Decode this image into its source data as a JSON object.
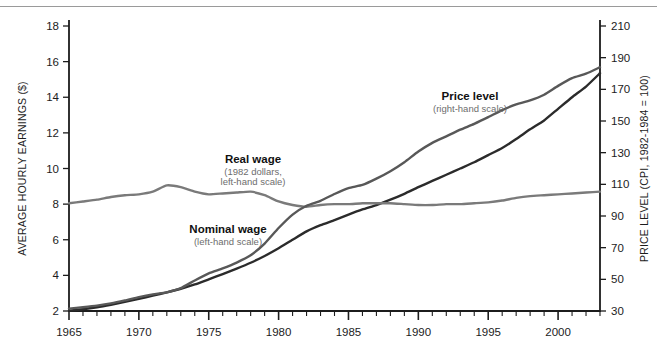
{
  "figure": {
    "background": "#ffffff",
    "border_color": "#9a9a9a"
  },
  "axes": {
    "left": {
      "title": "AVERAGE HOURLY EARNINGS ($)",
      "ticks": [
        "2",
        "4",
        "6",
        "8",
        "10",
        "12",
        "14",
        "16",
        "18"
      ],
      "min": 2,
      "max": 18
    },
    "right": {
      "title": "PRICE LEVEL (CPI, 1982-1984 = 100)",
      "ticks": [
        "30",
        "50",
        "70",
        "90",
        "110",
        "130",
        "150",
        "170",
        "190",
        "210"
      ],
      "min": 30,
      "max": 210
    },
    "bottom": {
      "ticks": [
        "1965",
        "1970",
        "1975",
        "1980",
        "1985",
        "1990",
        "1995",
        "2000"
      ],
      "min": 1965,
      "max": 2003
    }
  },
  "annotations": [
    {
      "id": "real-wage",
      "title": "Real wage",
      "sub_line1": "(1982 dollars,",
      "sub_line2": "left-hand scale)",
      "x": 253,
      "y": 163
    },
    {
      "id": "nominal-wage",
      "title": "Nominal wage",
      "sub_line1": "(left-hand scale)",
      "sub_line2": "",
      "x": 228,
      "y": 233
    },
    {
      "id": "price-level",
      "title": "Price level",
      "sub_line1": "(right-hand scale)",
      "sub_line2": "",
      "x": 470,
      "y": 100
    }
  ],
  "colors": {
    "nominal_wage": "#2b2b2b",
    "real_wage": "#7a7a7a",
    "price_level": "#585858",
    "axis": "#1c1c1c"
  },
  "chart_data": {
    "type": "line",
    "title": "",
    "xlabel": "",
    "ylabel": "AVERAGE HOURLY EARNINGS ($)",
    "y2label": "PRICE LEVEL (CPI, 1982-1984 = 100)",
    "xlim": [
      1965,
      2003
    ],
    "ylim": [
      2,
      18
    ],
    "y2lim": [
      30,
      210
    ],
    "grid": false,
    "legend": "annotations-inline",
    "x": [
      1965,
      1966,
      1967,
      1968,
      1969,
      1970,
      1971,
      1972,
      1973,
      1974,
      1975,
      1976,
      1977,
      1978,
      1979,
      1980,
      1981,
      1982,
      1983,
      1984,
      1985,
      1986,
      1987,
      1988,
      1989,
      1990,
      1991,
      1992,
      1993,
      1994,
      1995,
      1996,
      1997,
      1998,
      1999,
      2000,
      2001,
      2002,
      2003
    ],
    "series": [
      {
        "name": "Nominal wage",
        "axis": "left",
        "units": "dollars per hour",
        "color": "#2b2b2b",
        "values": [
          2.02,
          2.1,
          2.21,
          2.35,
          2.51,
          2.68,
          2.86,
          3.05,
          3.25,
          3.49,
          3.78,
          4.07,
          4.38,
          4.71,
          5.09,
          5.52,
          6.0,
          6.47,
          6.82,
          7.1,
          7.41,
          7.7,
          7.95,
          8.25,
          8.58,
          8.95,
          9.3,
          9.65,
          10.0,
          10.35,
          10.75,
          11.15,
          11.65,
          12.2,
          12.7,
          13.35,
          14.0,
          14.6,
          15.35
        ]
      },
      {
        "name": "Real wage",
        "axis": "left",
        "units": "1982 dollars per hour",
        "color": "#7a7a7a",
        "values": [
          8.05,
          8.15,
          8.25,
          8.4,
          8.5,
          8.55,
          8.7,
          9.05,
          8.95,
          8.7,
          8.55,
          8.6,
          8.65,
          8.7,
          8.5,
          8.15,
          7.95,
          7.85,
          7.95,
          8.0,
          8.0,
          8.05,
          8.05,
          8.05,
          8.0,
          7.95,
          7.95,
          8.0,
          8.0,
          8.05,
          8.1,
          8.2,
          8.35,
          8.45,
          8.5,
          8.55,
          8.6,
          8.65,
          8.7
        ]
      },
      {
        "name": "Price level",
        "axis": "right",
        "units": "CPI index (1982-1984 = 100)",
        "color": "#585858",
        "values": [
          31.5,
          32.4,
          33.4,
          34.8,
          36.7,
          38.8,
          40.5,
          41.8,
          44.4,
          49.3,
          53.8,
          56.9,
          60.6,
          65.2,
          72.6,
          82.4,
          90.9,
          96.5,
          99.6,
          103.9,
          107.6,
          109.6,
          113.6,
          118.3,
          124.0,
          130.7,
          136.2,
          140.3,
          144.5,
          148.2,
          152.4,
          156.9,
          160.5,
          163.0,
          166.6,
          172.2,
          177.1,
          179.9,
          184.0
        ]
      }
    ]
  }
}
